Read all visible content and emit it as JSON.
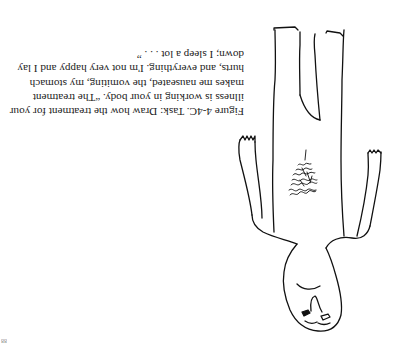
{
  "figure": {
    "label": "Figure 4-4C.",
    "task": "Task: Draw how the treatment for your illness is working in your body.",
    "quote": "“The treatment makes me nauseated, the vomiting, my stomach hurts, and everything. I'm not very happy and I lay down; I sleep a lot . . . ”",
    "orientation": "rotated 180 degrees"
  },
  "page_number": "88",
  "drawing": {
    "subject": "child-drawn human figure with scribbled stomach area",
    "stroke_color": "#111111"
  }
}
